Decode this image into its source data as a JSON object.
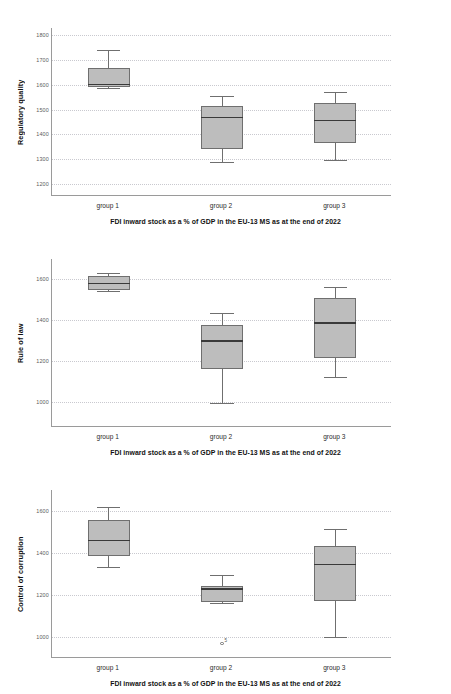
{
  "figure": {
    "caption": "FDI inward stock as a % of GDP in the EU-13 MS as at the end of 2022",
    "categories": [
      "group 1",
      "group 2",
      "group 3"
    ],
    "box_fill": "#bdbdbd",
    "box_edge": "#6f6f6f",
    "median_color": "#3a3a3a",
    "grid_color": "#c9c9cf"
  },
  "panels": [
    {
      "ylabel": "Regulatory quality",
      "ticks": [
        "1200",
        "1300",
        "1400",
        "1500",
        "1600",
        "1700",
        "1800"
      ],
      "tick_values": [
        1200,
        1300,
        1400,
        1500,
        1600,
        1700,
        1800
      ]
    },
    {
      "ylabel": "Rule of law",
      "ticks": [
        "1000",
        "1200",
        "1400",
        "1600"
      ],
      "tick_values": [
        1000,
        1200,
        1400,
        1600
      ]
    },
    {
      "ylabel": "Control of corruption",
      "ticks": [
        "1000",
        "1200",
        "1400",
        "1600"
      ],
      "tick_values": [
        1000,
        1200,
        1400,
        1600
      ]
    }
  ],
  "chart_data": [
    {
      "type": "box",
      "title": "",
      "ylabel": "Regulatory quality",
      "xlabel": "FDI inward stock as a % of GDP in the EU-13 MS as at the end of 2022",
      "categories": [
        "group 1",
        "group 2",
        "group 3"
      ],
      "ylim": [
        1150,
        1830
      ],
      "yticks": [
        1200,
        1300,
        1400,
        1500,
        1600,
        1700,
        1800
      ],
      "grid": true,
      "boxes": [
        {
          "category": "group 1",
          "whisker_low": 1588,
          "q1": 1592,
          "median": 1602,
          "q3": 1667,
          "whisker_high": 1739,
          "outliers": []
        },
        {
          "category": "group 2",
          "whisker_low": 1287,
          "q1": 1339,
          "median": 1468,
          "q3": 1513,
          "whisker_high": 1556,
          "outliers": []
        },
        {
          "category": "group 3",
          "whisker_low": 1294,
          "q1": 1364,
          "median": 1455,
          "q3": 1527,
          "whisker_high": 1571,
          "outliers": []
        }
      ]
    },
    {
      "type": "box",
      "title": "",
      "ylabel": "Rule of law",
      "xlabel": "FDI inward stock as a % of GDP in the EU-13 MS as at the end of 2022",
      "categories": [
        "group 1",
        "group 2",
        "group 3"
      ],
      "ylim": [
        880,
        1700
      ],
      "yticks": [
        1000,
        1200,
        1400,
        1600
      ],
      "grid": true,
      "boxes": [
        {
          "category": "group 1",
          "whisker_low": 1545,
          "q1": 1548,
          "median": 1580,
          "q3": 1615,
          "whisker_high": 1631,
          "outliers": []
        },
        {
          "category": "group 2",
          "whisker_low": 999,
          "q1": 1163,
          "median": 1300,
          "q3": 1376,
          "whisker_high": 1436,
          "outliers": []
        },
        {
          "category": "group 3",
          "whisker_low": 1124,
          "q1": 1217,
          "median": 1389,
          "q3": 1508,
          "whisker_high": 1565,
          "outliers": []
        }
      ]
    },
    {
      "type": "box",
      "title": "",
      "ylabel": "Control of corruption",
      "xlabel": "FDI inward stock as a % of GDP in the EU-13 MS as at the end of 2022",
      "categories": [
        "group 1",
        "group 2",
        "group 3"
      ],
      "ylim": [
        900,
        1700
      ],
      "yticks": [
        1000,
        1200,
        1400,
        1600
      ],
      "grid": true,
      "boxes": [
        {
          "category": "group 1",
          "whisker_low": 1332,
          "q1": 1386,
          "median": 1460,
          "q3": 1558,
          "whisker_high": 1621,
          "outliers": []
        },
        {
          "category": "group 2",
          "whisker_low": 1163,
          "q1": 1167,
          "median": 1228,
          "q3": 1243,
          "whisker_high": 1297,
          "outliers": [
            {
              "value": 968,
              "label": "5"
            }
          ]
        },
        {
          "category": "group 3",
          "whisker_low": 1000,
          "q1": 1172,
          "median": 1345,
          "q3": 1431,
          "whisker_high": 1516,
          "outliers": []
        }
      ]
    }
  ]
}
